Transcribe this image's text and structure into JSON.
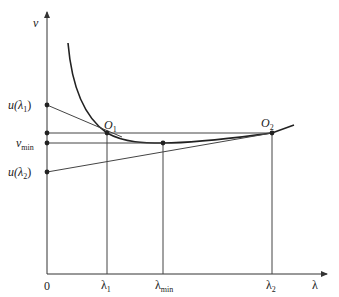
{
  "diagram": {
    "axes": {
      "y_label": "v",
      "x_label": "λ",
      "origin_label": "0"
    },
    "y_ticks": [
      {
        "id": "u_lambda1",
        "label": "u(λ",
        "sub": "1",
        "suffix": ")"
      },
      {
        "id": "v_min",
        "label": "v",
        "sub": "min"
      },
      {
        "id": "u_lambda2",
        "label": "u(λ",
        "sub": "2",
        "suffix": ")"
      }
    ],
    "x_ticks": [
      {
        "id": "lambda1",
        "label": "λ",
        "sub": "1"
      },
      {
        "id": "lambda_min",
        "label": "λ",
        "sub": "min"
      },
      {
        "id": "lambda2",
        "label": "λ",
        "sub": "2"
      }
    ],
    "points": [
      {
        "id": "O1",
        "label": "O",
        "sub": "1"
      },
      {
        "id": "O2",
        "label": "O",
        "sub": "2"
      }
    ],
    "colors": {
      "line": "#333333",
      "curve": "#222222"
    }
  }
}
